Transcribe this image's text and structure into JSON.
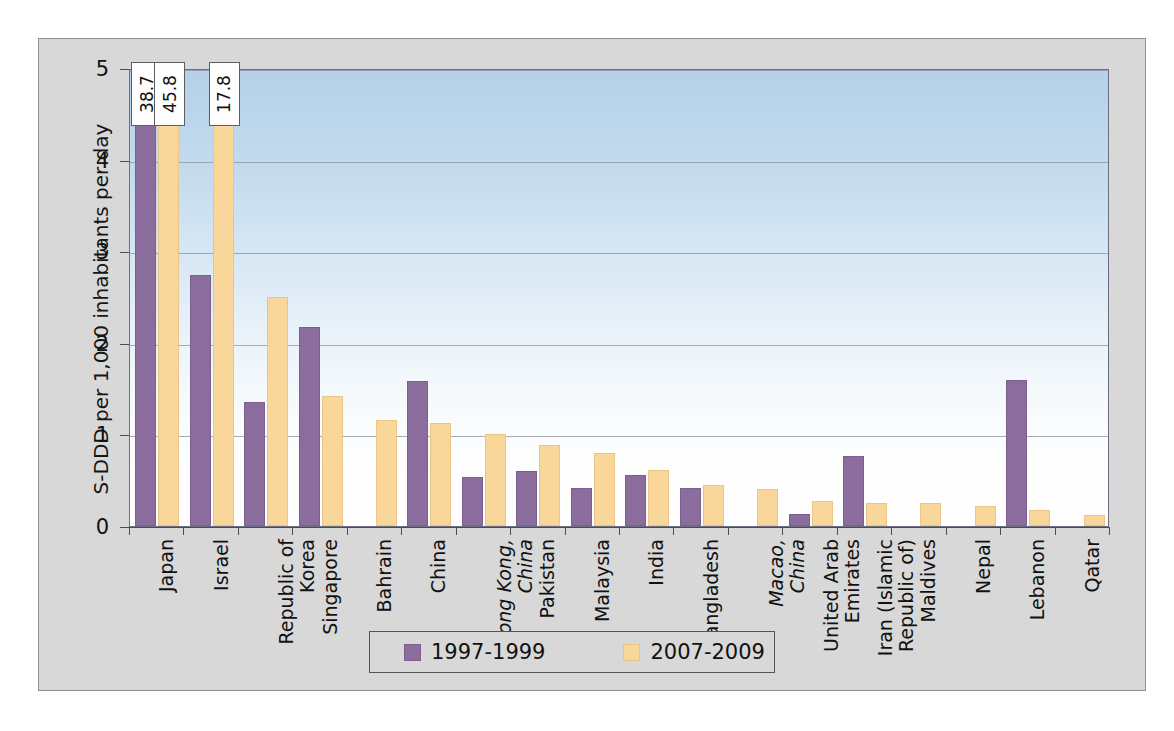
{
  "chart_data": {
    "type": "bar",
    "title": "",
    "xlabel": "",
    "ylabel": "S-DDD per 1,000 inhabitants per day",
    "ylim": [
      0,
      5
    ],
    "yticks": [
      "0",
      "1",
      "2",
      "3",
      "4",
      "5"
    ],
    "grid": true,
    "legend_position": "bottom",
    "categories": [
      "Japan",
      "Israel",
      "Republic of Korea",
      "Singapore",
      "Bahrain",
      "China",
      "Hong Kong, China",
      "Pakistan",
      "Malaysia",
      "India",
      "Bangladesh",
      "Macao, China",
      "United Arab Emirates",
      "Iran (Islamic Republic of)",
      "Maldives",
      "Nepal",
      "Lebanon",
      "Qatar"
    ],
    "category_lines": [
      [
        "Japan"
      ],
      [
        "Israel"
      ],
      [
        "Republic of",
        "Korea"
      ],
      [
        "Singapore"
      ],
      [
        "Bahrain"
      ],
      [
        "China"
      ],
      [
        "Hong Kong,",
        "China"
      ],
      [
        "Pakistan"
      ],
      [
        "Malaysia"
      ],
      [
        "India"
      ],
      [
        "Bangladesh"
      ],
      [
        "Macao,",
        "China"
      ],
      [
        "United Arab",
        "Emirates"
      ],
      [
        "Iran (Islamic",
        "Republic of)"
      ],
      [
        "Maldives"
      ],
      [
        "Nepal"
      ],
      [
        "Lebanon"
      ],
      [
        "Qatar"
      ]
    ],
    "category_italic": [
      false,
      false,
      false,
      false,
      false,
      false,
      true,
      false,
      false,
      false,
      false,
      true,
      false,
      false,
      false,
      false,
      false,
      false
    ],
    "series": [
      {
        "name": "1997-1999",
        "color": "#8c6e9e",
        "values": [
          38.7,
          2.74,
          1.35,
          2.17,
          null,
          1.58,
          0.53,
          0.6,
          0.42,
          0.56,
          0.41,
          null,
          0.13,
          0.76,
          null,
          null,
          1.59,
          null
        ]
      },
      {
        "name": "2007-2009",
        "color": "#fad89c",
        "values": [
          45.8,
          17.8,
          2.5,
          1.42,
          1.16,
          1.13,
          1.0,
          0.88,
          0.8,
          0.61,
          0.45,
          0.4,
          0.27,
          0.25,
          0.25,
          0.22,
          0.18,
          0.12
        ]
      }
    ],
    "value_callouts": [
      {
        "category": "Japan",
        "series": "1997-1999",
        "label": "38.7"
      },
      {
        "category": "Japan",
        "series": "2007-2009",
        "label": "45.8"
      },
      {
        "category": "Israel",
        "series": "2007-2009",
        "label": "17.8"
      }
    ]
  },
  "legend": {
    "items": [
      {
        "label": "1997-1999",
        "color": "#8c6e9e"
      },
      {
        "label": "2007-2009",
        "color": "#fad89c"
      }
    ]
  },
  "colors": {
    "series1": "#8c6e9e",
    "series2": "#fad89c",
    "plot_top": "#b5d2ea",
    "figure_background": "#d9d9d9"
  }
}
